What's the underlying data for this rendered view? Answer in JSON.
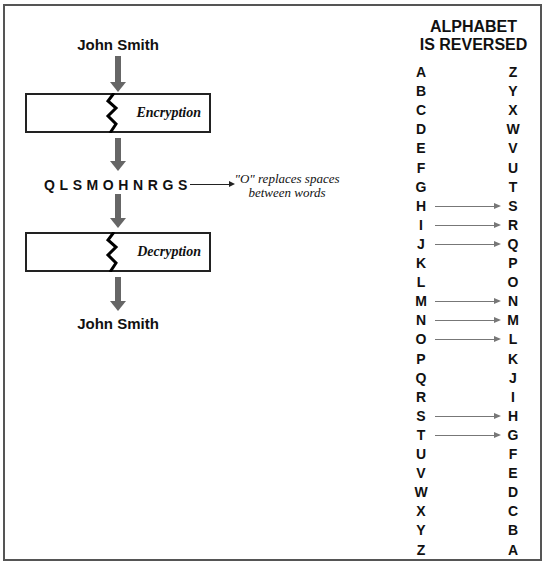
{
  "diagram": {
    "plaintext_top": "John Smith",
    "encryption_label": "Encryption",
    "ciphertext": "QLSMOHNRGS",
    "note": [
      "\"O\" replaces spaces",
      "between words"
    ],
    "decryption_label": "Decryption",
    "plaintext_bottom": "John Smith"
  },
  "alphabet": {
    "title": [
      "ALPHABET",
      "IS REVERSED"
    ],
    "rows": [
      {
        "from": "A",
        "to": "Z",
        "arrow": false
      },
      {
        "from": "B",
        "to": "Y",
        "arrow": false
      },
      {
        "from": "C",
        "to": "X",
        "arrow": false
      },
      {
        "from": "D",
        "to": "W",
        "arrow": false
      },
      {
        "from": "E",
        "to": "V",
        "arrow": false
      },
      {
        "from": "F",
        "to": "U",
        "arrow": false
      },
      {
        "from": "G",
        "to": "T",
        "arrow": false
      },
      {
        "from": "H",
        "to": "S",
        "arrow": true
      },
      {
        "from": "I",
        "to": "R",
        "arrow": true
      },
      {
        "from": "J",
        "to": "Q",
        "arrow": true
      },
      {
        "from": "K",
        "to": "P",
        "arrow": false
      },
      {
        "from": "L",
        "to": "O",
        "arrow": false
      },
      {
        "from": "M",
        "to": "N",
        "arrow": true
      },
      {
        "from": "N",
        "to": "M",
        "arrow": true
      },
      {
        "from": "O",
        "to": "L",
        "arrow": true
      },
      {
        "from": "P",
        "to": "K",
        "arrow": false
      },
      {
        "from": "Q",
        "to": "J",
        "arrow": false
      },
      {
        "from": "R",
        "to": "I",
        "arrow": false
      },
      {
        "from": "S",
        "to": "H",
        "arrow": true
      },
      {
        "from": "T",
        "to": "G",
        "arrow": true
      },
      {
        "from": "U",
        "to": "F",
        "arrow": false
      },
      {
        "from": "V",
        "to": "E",
        "arrow": false
      },
      {
        "from": "W",
        "to": "D",
        "arrow": false
      },
      {
        "from": "X",
        "to": "C",
        "arrow": false
      },
      {
        "from": "Y",
        "to": "B",
        "arrow": false
      },
      {
        "from": "Z",
        "to": "A",
        "arrow": false
      }
    ]
  },
  "colors": {
    "arrow": "#666666",
    "border": "#555555",
    "map_arrow": "#777777"
  }
}
